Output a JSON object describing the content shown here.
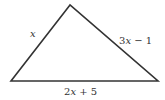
{
  "diagram": {
    "type": "triangle",
    "vertices": {
      "top": [
        70,
        5
      ],
      "bottom_left": [
        11,
        81
      ],
      "bottom_right": [
        158,
        81
      ]
    },
    "stroke_color": "#333333",
    "sides": {
      "left": {
        "var": "x",
        "rest": ""
      },
      "right": {
        "var": "x",
        "prefix": "3",
        "rest": " − 1"
      },
      "bottom": {
        "var": "x",
        "prefix": "2",
        "rest": " + 5"
      }
    }
  }
}
